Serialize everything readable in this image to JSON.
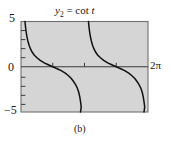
{
  "figure": {
    "caption": "(b)",
    "title": {
      "var": "y",
      "subscript": "2",
      "equals": "=",
      "function": "cot",
      "argument": "t",
      "full": "y2 = cot t"
    },
    "colors": {
      "plot_background": "#d5d5d5",
      "frame": "#6b6b6b",
      "curve": "#111111",
      "axis": "#3a3a3a",
      "text": "#171717",
      "page_background": "#ffffff"
    },
    "axes": {
      "y_top_label": "5",
      "y_zero_label": "0",
      "y_bottom_label": "−5",
      "x_right_label": "2π"
    }
  },
  "chart_data": {
    "type": "line",
    "xlabel": "t",
    "ylabel": "y",
    "xlim": [
      0,
      6.283185
    ],
    "ylim": [
      -5,
      5
    ],
    "x_tick_labels": [
      "2π"
    ],
    "x_tick_values": [
      1.570796,
      3.141593,
      4.712389
    ],
    "y_tick_labels": [
      "5",
      "0",
      "−5"
    ],
    "y_tick_values": [
      5,
      0,
      -5
    ],
    "grid": false,
    "legend": false,
    "asymptotes": [
      0,
      3.141593,
      6.283185
    ],
    "series": [
      {
        "name": "cot t (branch 1)",
        "x": [
          0.197,
          0.22,
          0.25,
          0.29,
          0.34,
          0.4,
          0.47,
          0.55,
          0.65,
          0.79,
          0.95,
          1.15,
          1.35,
          1.571,
          1.79,
          1.99,
          2.19,
          2.35,
          2.49,
          2.6,
          2.7,
          2.79,
          2.86,
          2.91,
          2.95,
          2.98,
          2.944
        ],
        "y": [
          5.0,
          4.47,
          3.92,
          3.36,
          2.85,
          2.37,
          1.97,
          1.63,
          1.3,
          0.99,
          0.71,
          0.43,
          0.22,
          0.0,
          -0.22,
          -0.43,
          -0.71,
          -0.99,
          -1.3,
          -1.63,
          -1.97,
          -2.37,
          -2.85,
          -3.36,
          -3.92,
          -4.47,
          -5.0
        ]
      },
      {
        "name": "cot t (branch 2)",
        "x": [
          3.339,
          3.36,
          3.39,
          3.43,
          3.48,
          3.54,
          3.61,
          3.69,
          3.79,
          3.93,
          4.09,
          4.29,
          4.49,
          4.712,
          4.93,
          5.13,
          5.33,
          5.49,
          5.63,
          5.74,
          5.84,
          5.93,
          6.0,
          6.05,
          6.09,
          6.12,
          6.086
        ],
        "y": [
          5.0,
          4.47,
          3.92,
          3.36,
          2.85,
          2.37,
          1.97,
          1.63,
          1.3,
          0.99,
          0.71,
          0.43,
          0.22,
          0.0,
          -0.22,
          -0.43,
          -0.71,
          -0.99,
          -1.3,
          -1.63,
          -1.97,
          -2.37,
          -2.85,
          -3.36,
          -3.92,
          -4.47,
          -5.0
        ]
      }
    ]
  }
}
